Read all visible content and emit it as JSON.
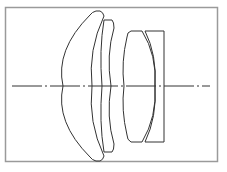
{
  "diagram": {
    "type": "optical-lens-cross-section",
    "frame": {
      "x": 5,
      "y": 7,
      "width": 213,
      "height": 155,
      "stroke": "#9a9a9a"
    },
    "optical_axis": {
      "y": 86,
      "x_start": 12,
      "x_end": 210,
      "style": "dash-dot",
      "stroke": "#333333"
    },
    "line_color": "#333333",
    "elements": [
      {
        "id": "lens-1",
        "kind": "positive-meniscus"
      },
      {
        "id": "lens-2",
        "kind": "negative-meniscus"
      },
      {
        "id": "lens-3",
        "kind": "biconvex"
      },
      {
        "id": "lens-4",
        "kind": "plano-concave"
      }
    ],
    "element_count": 4
  }
}
